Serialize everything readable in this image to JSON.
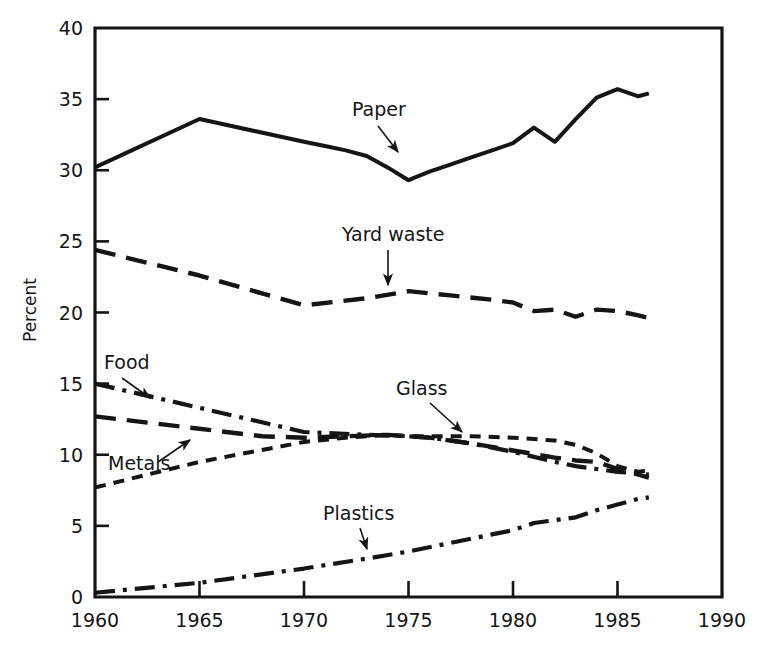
{
  "chart_data": {
    "type": "line",
    "title": "",
    "xlabel": "",
    "ylabel": "Percent",
    "xlim": [
      1960,
      1990
    ],
    "ylim": [
      0,
      40
    ],
    "xticks": [
      1960,
      1965,
      1970,
      1975,
      1980,
      1985,
      1990
    ],
    "yticks": [
      0,
      5,
      10,
      15,
      20,
      25,
      30,
      35,
      40
    ],
    "xtick_labels": [
      "1960",
      "1965",
      "1970",
      "1975",
      "1980",
      "1985",
      "1990"
    ],
    "ytick_labels": [
      "0",
      "5",
      "10",
      "15",
      "20",
      "25",
      "30",
      "35",
      "40"
    ],
    "grid": false,
    "legend": "inline-annotations",
    "series": [
      {
        "name": "Paper",
        "label": "Paper",
        "style": "solid",
        "x": [
          1960,
          1965,
          1970,
          1971,
          1972,
          1973,
          1974,
          1975,
          1976,
          1977,
          1978,
          1979,
          1980,
          1981,
          1982,
          1983,
          1984,
          1985,
          1986,
          1986.5
        ],
        "values": [
          30.2,
          33.6,
          32.0,
          31.7,
          31.4,
          31.0,
          30.2,
          29.3,
          29.9,
          30.4,
          30.9,
          31.4,
          31.9,
          33.0,
          32.0,
          33.6,
          35.1,
          35.7,
          35.2,
          35.4
        ]
      },
      {
        "name": "Yard waste",
        "label": "Yard waste",
        "style": "dashed-long",
        "x": [
          1960,
          1965,
          1970,
          1973,
          1975,
          1977,
          1979,
          1980,
          1981,
          1982,
          1983,
          1984,
          1985,
          1986,
          1986.5
        ],
        "values": [
          24.4,
          22.6,
          20.5,
          21.0,
          21.5,
          21.2,
          20.9,
          20.7,
          20.1,
          20.2,
          19.7,
          20.2,
          20.1,
          19.8,
          19.6
        ]
      },
      {
        "name": "Food",
        "label": "Food",
        "style": "dash-dot",
        "x": [
          1960,
          1965,
          1970,
          1973,
          1975,
          1976,
          1978,
          1980,
          1982,
          1983,
          1984,
          1985,
          1986,
          1986.5
        ],
        "values": [
          15.0,
          13.3,
          11.6,
          11.4,
          11.3,
          11.2,
          10.8,
          10.2,
          9.5,
          9.2,
          9.0,
          8.8,
          8.7,
          8.6
        ]
      },
      {
        "name": "Metals",
        "label": "Metals",
        "style": "dashed-long",
        "x": [
          1960,
          1968,
          1970,
          1972,
          1974,
          1975,
          1976,
          1978,
          1980,
          1982,
          1983,
          1984,
          1985,
          1986,
          1986.5
        ],
        "values": [
          12.7,
          11.3,
          11.2,
          11.3,
          11.4,
          11.3,
          11.2,
          10.8,
          10.3,
          9.8,
          9.6,
          9.5,
          9.0,
          8.6,
          8.4
        ]
      },
      {
        "name": "Glass",
        "label": "Glass",
        "style": "dashed-short",
        "x": [
          1960,
          1965,
          1970,
          1972,
          1974,
          1975,
          1976,
          1978,
          1980,
          1982,
          1983,
          1984,
          1985,
          1986,
          1986.5
        ],
        "values": [
          7.7,
          9.5,
          10.9,
          11.2,
          11.4,
          11.3,
          11.3,
          11.3,
          11.2,
          11.0,
          10.7,
          10.1,
          9.2,
          8.8,
          8.9
        ]
      },
      {
        "name": "Plastics",
        "label": "Plastics",
        "style": "dash-dot",
        "x": [
          1960,
          1965,
          1970,
          1973,
          1975,
          1977,
          1979,
          1980,
          1981,
          1982,
          1983,
          1984,
          1985,
          1986,
          1986.5
        ],
        "values": [
          0.3,
          1.0,
          2.0,
          2.7,
          3.2,
          3.8,
          4.4,
          4.7,
          5.2,
          5.4,
          5.6,
          6.1,
          6.5,
          6.9,
          7.0
        ]
      }
    ],
    "annotations": [
      {
        "label": "Paper",
        "text_x": 352,
        "text_y": 116,
        "arrow_from_x": 378,
        "arrow_from_y": 126,
        "arrow_to_x": 398,
        "arrow_to_y": 152
      },
      {
        "label": "Yard waste",
        "text_x": 342,
        "text_y": 241,
        "arrow_from_x": 388,
        "arrow_from_y": 250,
        "arrow_to_x": 388,
        "arrow_to_y": 285
      },
      {
        "label": "Food",
        "text_x": 104,
        "text_y": 369,
        "arrow_from_x": 122,
        "arrow_from_y": 378,
        "arrow_to_x": 150,
        "arrow_to_y": 398
      },
      {
        "label": "Metals",
        "text_x": 108,
        "text_y": 470,
        "arrow_from_x": 158,
        "arrow_from_y": 462,
        "arrow_to_x": 190,
        "arrow_to_y": 440
      },
      {
        "label": "Glass",
        "text_x": 396,
        "text_y": 395,
        "arrow_from_x": 430,
        "arrow_from_y": 403,
        "arrow_to_x": 462,
        "arrow_to_y": 432
      },
      {
        "label": "Plastics",
        "text_x": 323,
        "text_y": 520,
        "arrow_from_x": 360,
        "arrow_from_y": 528,
        "arrow_to_x": 367,
        "arrow_to_y": 549
      }
    ],
    "colors": {
      "line": "#151515",
      "background": "#ffffff",
      "text": "#151515"
    }
  }
}
